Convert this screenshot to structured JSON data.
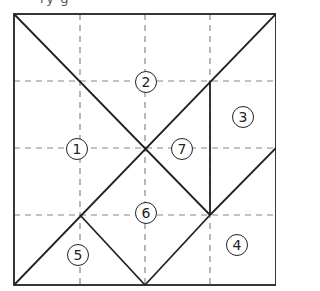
{
  "top_text_fragment": "ry g",
  "diagram": {
    "type": "tangram-square",
    "pieces": [
      {
        "id": "1",
        "label": "1",
        "x": 77,
        "y": 149
      },
      {
        "id": "2",
        "label": "2",
        "x": 146,
        "y": 82
      },
      {
        "id": "3",
        "label": "3",
        "x": 243,
        "y": 117
      },
      {
        "id": "4",
        "label": "4",
        "x": 237,
        "y": 245
      },
      {
        "id": "5",
        "label": "5",
        "x": 78,
        "y": 255
      },
      {
        "id": "6",
        "label": "6",
        "x": 146,
        "y": 213
      },
      {
        "id": "7",
        "label": "7",
        "x": 182,
        "y": 149
      }
    ]
  }
}
